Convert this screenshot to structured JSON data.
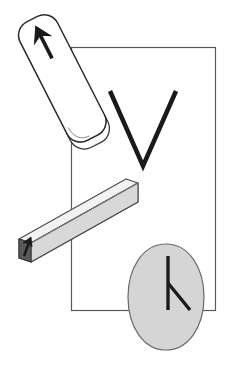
{
  "figure": {
    "background_color": "#ffffff",
    "width": 230,
    "height": 375,
    "caption_text": "",
    "elements": [
      {
        "id": "reference-frame-rectangle",
        "label": "Reference frame rectangle",
        "shape": "rectangle",
        "stroke_color": "#595959",
        "fill_color": "none",
        "stroke_width": 1.2,
        "x": 71,
        "y": 47,
        "width": 145,
        "height": 264
      },
      {
        "id": "rounded-bar",
        "label": "Rounded bar with up arrow",
        "shape": "rounded-rectangle-3d",
        "stroke_color": "#2b2b2b",
        "fill_color": "#ffffff",
        "stroke_width": 1.4,
        "rotation_degrees": -27,
        "center_x": 63,
        "center_y": 82,
        "bar_width": 44,
        "bar_height": 138,
        "corner_radius": 14,
        "arrow_label": "up-right arrow"
      },
      {
        "id": "beam-prism",
        "label": "Gray 3D beam with arrow on end",
        "shape": "rectangular-prism",
        "stroke_color": "#4a4a4a",
        "fill_color": "#d8d8d8",
        "end_face_color": "#5a5a5a",
        "stroke_width": 1.1,
        "rotation_degrees": -21,
        "start_x": 18,
        "start_y": 255,
        "end_x": 136,
        "end_y": 188,
        "arrow_label": "up arrow on beam face"
      },
      {
        "id": "rotating-ellipse",
        "label": "Gray ellipse with clock hands and motion dashes",
        "shape": "ellipse",
        "stroke_color": "#6b6b6b",
        "fill_color": "#d5d5d5",
        "stroke_width": 1.2,
        "center_x": 166,
        "center_y": 297,
        "radius_x": 38,
        "radius_y": 53,
        "motion_dash_color": "#b0b0b0",
        "hand_color": "#1a1a1a"
      },
      {
        "id": "v-angle-mark",
        "label": "V shaped angle mark",
        "shape": "polyline",
        "stroke_color": "#1a1a1a",
        "fill_color": "none",
        "stroke_width": 4.5,
        "points": "110,91 143,166 176,91"
      }
    ]
  },
  "colors": {
    "ink": "#1a1a1a",
    "frame_stroke": "#595959",
    "gray_fill": "#d5d5d5",
    "beam_fill": "#d8d8d8",
    "beam_top_fill": "#f0f0f0",
    "beam_end_fill": "#5a5a5a",
    "motion_dash": "#b0b0b0",
    "white": "#ffffff"
  }
}
